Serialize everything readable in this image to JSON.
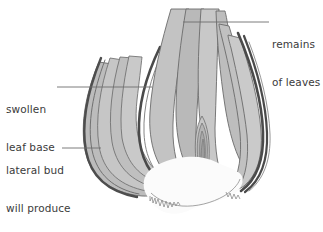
{
  "figure": {
    "background_color": "#ffffff",
    "scale_fill_color": "#bcbcbc",
    "scale_fill_color_light": "#cfcfcf",
    "outline_color": "#5a5a5a",
    "dark_tunic_color": "#4a4a4a",
    "base_plate_color": "#fafafa",
    "leader_line_color": "#6e6e6e",
    "text_color": "#3b3b3b"
  },
  "labels": {
    "remains_of_leaves": {
      "line1": "remains",
      "line2": "of leaves"
    },
    "swollen_leaf_base": {
      "line1": "swollen",
      "line2": "leaf base"
    },
    "lateral_bud": {
      "line1": "lateral bud",
      "line2": "will produce",
      "line3": "new plant"
    }
  }
}
